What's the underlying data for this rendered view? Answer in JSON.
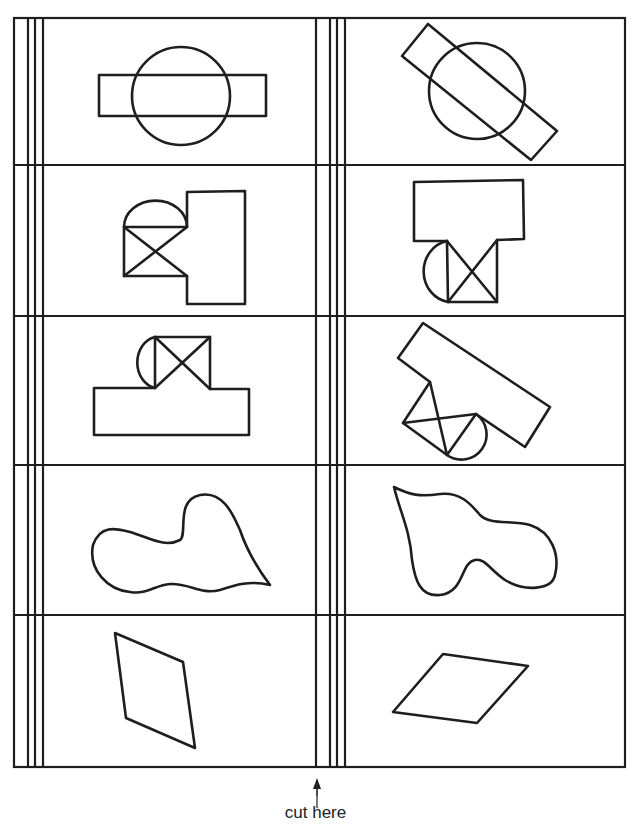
{
  "worksheet": {
    "layout": {
      "rows": 5,
      "columns": 2
    },
    "colors": {
      "ink": "#1e1e1e",
      "paper": "#ffffff"
    },
    "rows": [
      {
        "index": 1,
        "left_shape": "circle-over-horizontal-bar",
        "right_shape": "circle-over-diagonal-bar"
      },
      {
        "index": 2,
        "left_shape": "rectangle-with-crossed-box-and-semicircle-left",
        "right_shape": "rectangle-with-crossed-box-and-semicircle-below"
      },
      {
        "index": 3,
        "left_shape": "bar-with-crossed-box-and-semicircle-on-top",
        "right_shape": "tilted-bar-with-crossed-box-and-semicircle"
      },
      {
        "index": 4,
        "left_shape": "irregular-blob",
        "right_shape": "irregular-blob-rotated"
      },
      {
        "index": 5,
        "left_shape": "parallelogram-tall",
        "right_shape": "parallelogram-flat"
      }
    ],
    "cut_label": "cut here",
    "cut_arrow_icon": "arrow-up-icon"
  }
}
